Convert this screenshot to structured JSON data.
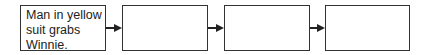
{
  "diagram": {
    "type": "flowchart",
    "boxes": [
      {
        "text": "Man in yellow\nsuit grabs\nWinnie."
      },
      {
        "text": ""
      },
      {
        "text": ""
      },
      {
        "text": ""
      }
    ],
    "arrows": [
      {
        "from": 0,
        "to": 1
      },
      {
        "from": 1,
        "to": 2
      },
      {
        "from": 2,
        "to": 3
      }
    ]
  }
}
